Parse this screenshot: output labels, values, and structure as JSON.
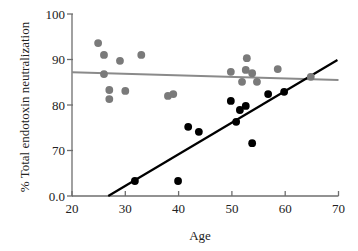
{
  "chart_data": {
    "type": "scatter",
    "title": "",
    "xlabel": "Age",
    "ylabel": "% Total endotoxin neutralization",
    "xlim": [
      20,
      70
    ],
    "ylim": [
      60,
      100
    ],
    "x_ticks": [
      20,
      30,
      40,
      50,
      60,
      70
    ],
    "y_ticks": [
      {
        "value": 100,
        "label": "100"
      },
      {
        "value": 90,
        "label": "90"
      },
      {
        "value": 80,
        "label": "80"
      },
      {
        "value": 70,
        "label": "70"
      },
      {
        "value": 60,
        "label": "0.0"
      }
    ],
    "grid": false,
    "legend": null,
    "series": [
      {
        "name": "Gray group",
        "color": "#7a7a7a",
        "points": [
          [
            24.9,
            93.6
          ],
          [
            26.0,
            91.0
          ],
          [
            26.0,
            86.8
          ],
          [
            29.0,
            89.7
          ],
          [
            33.0,
            91.0
          ],
          [
            27.0,
            83.3
          ],
          [
            27.0,
            81.3
          ],
          [
            30.0,
            83.1
          ],
          [
            38.0,
            82.0
          ],
          [
            39.0,
            82.4
          ],
          [
            49.8,
            87.3
          ],
          [
            52.8,
            90.3
          ],
          [
            52.6,
            87.7
          ],
          [
            53.8,
            87.0
          ],
          [
            51.9,
            85.1
          ],
          [
            54.7,
            85.1
          ],
          [
            58.6,
            87.9
          ],
          [
            64.8,
            86.2
          ]
        ],
        "fit_line": {
          "x": [
            20,
            70
          ],
          "y": [
            87.2,
            85.5
          ],
          "color": "#8a8a8a"
        }
      },
      {
        "name": "Black group",
        "color": "#000000",
        "points": [
          [
            31.8,
            63.3
          ],
          [
            39.9,
            63.3
          ],
          [
            41.8,
            75.2
          ],
          [
            43.8,
            74.1
          ],
          [
            49.8,
            80.9
          ],
          [
            51.5,
            78.9
          ],
          [
            52.6,
            79.8
          ],
          [
            50.8,
            76.3
          ],
          [
            56.8,
            82.4
          ],
          [
            59.8,
            82.9
          ],
          [
            53.8,
            71.6
          ]
        ],
        "fit_line": {
          "x": [
            26.8,
            69.8
          ],
          "y": [
            60.0,
            89.9
          ],
          "color": "#000000"
        }
      }
    ],
    "layout": {
      "plot_left": 72,
      "plot_right": 338.5,
      "plot_top": 14,
      "plot_bottom": 196,
      "axis_color": "#6e6e6e"
    }
  }
}
